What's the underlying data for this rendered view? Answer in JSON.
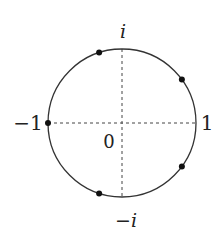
{
  "diagram": {
    "type": "unit-circle-complex-plane",
    "center": [
      122,
      123
    ],
    "radius": 74,
    "labels": {
      "top": "i",
      "bottom": "−i",
      "left": "−1",
      "right": "1",
      "origin": "0"
    },
    "points_angles_deg": [
      108,
      36,
      -36,
      -108,
      180
    ],
    "colors": {
      "stroke": "#333333",
      "dot": "#111111",
      "axis": "#444444"
    }
  }
}
